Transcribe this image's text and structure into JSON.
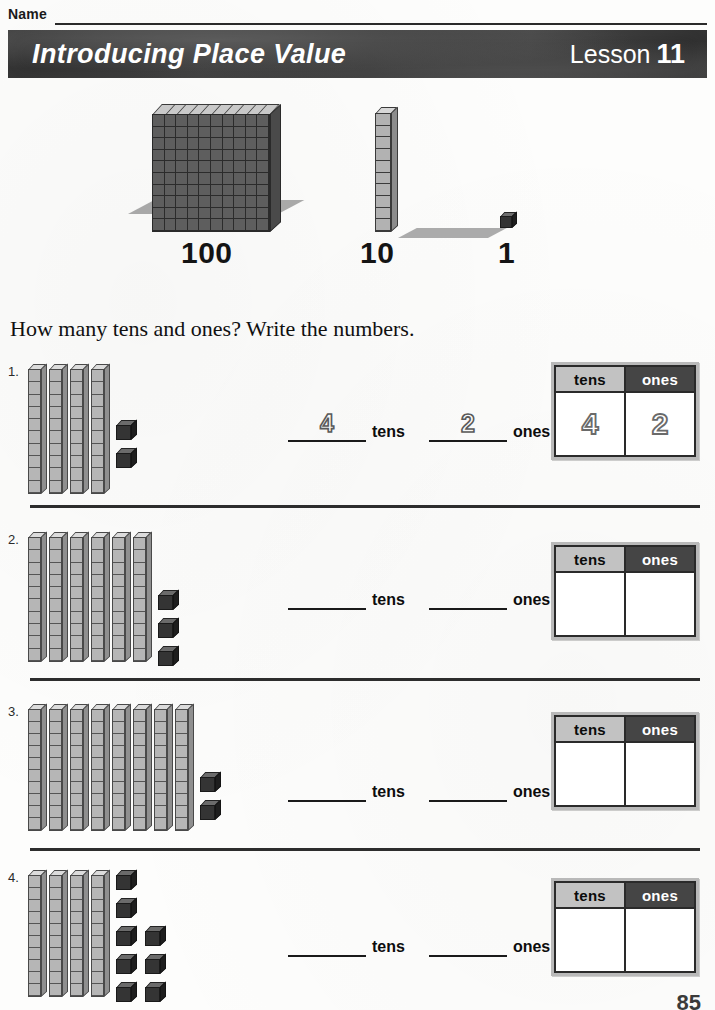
{
  "page": {
    "name_label": "Name",
    "title": "Introducing Place Value",
    "lesson_word": "Lesson",
    "lesson_number": "11",
    "instruction": "How many tens and ones? Write the numbers.",
    "page_number": "85",
    "colors": {
      "title_bar": "#343434",
      "ones_header_bg": "#454545",
      "tens_header_bg": "#c2c2c2",
      "rod_face": "#b6b6b6",
      "cube_face": "#343434",
      "hundred_face": "#5e5e5e"
    }
  },
  "hero": {
    "items": [
      {
        "icon": "hundreds-flat-icon",
        "label": "100",
        "rows": 10,
        "cols": 10
      },
      {
        "icon": "tens-rod-icon",
        "label": "10",
        "units": 10
      },
      {
        "icon": "ones-cube-icon",
        "label": "1",
        "units": 1
      }
    ]
  },
  "table_headers": {
    "tens": "tens",
    "ones": "ones"
  },
  "answer_words": {
    "tens": "tens",
    "ones": "ones"
  },
  "problems": [
    {
      "number": "1.",
      "rods": 4,
      "ones": 2,
      "ones_layout": [
        2
      ],
      "answer_tens": "4",
      "answer_ones": "2",
      "table_tens": "4",
      "table_ones": "2"
    },
    {
      "number": "2.",
      "rods": 6,
      "ones": 3,
      "ones_layout": [
        3
      ],
      "answer_tens": "",
      "answer_ones": "",
      "table_tens": "",
      "table_ones": ""
    },
    {
      "number": "3.",
      "rods": 8,
      "ones": 2,
      "ones_layout": [
        2
      ],
      "answer_tens": "",
      "answer_ones": "",
      "table_tens": "",
      "table_ones": ""
    },
    {
      "number": "4.",
      "rods": 4,
      "ones": 8,
      "ones_layout": [
        5,
        3
      ],
      "answer_tens": "",
      "answer_ones": "",
      "table_tens": "",
      "table_ones": ""
    }
  ]
}
